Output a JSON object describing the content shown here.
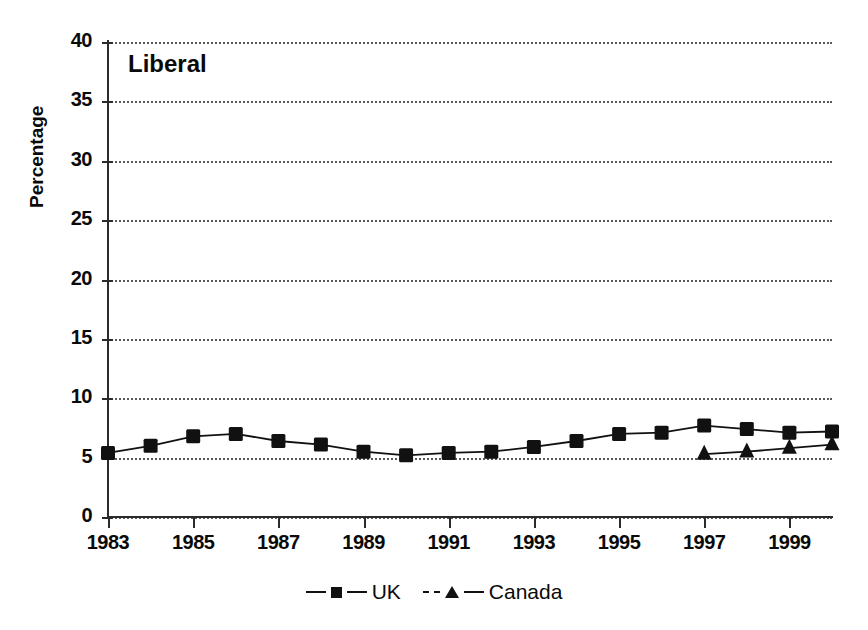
{
  "chart_data": {
    "type": "line",
    "title": "Liberal",
    "xlabel": "",
    "ylabel": "Percentage",
    "xlim": [
      1983,
      2000
    ],
    "ylim": [
      0,
      40
    ],
    "ytick_values": [
      0,
      5,
      10,
      15,
      20,
      25,
      30,
      35,
      40
    ],
    "ytick_labels": [
      "0",
      "5",
      "10",
      "15",
      "20",
      "25",
      "30",
      "35",
      "40"
    ],
    "xtick_values": [
      1983,
      1985,
      1987,
      1989,
      1991,
      1993,
      1995,
      1997,
      1999
    ],
    "xtick_labels": [
      "1983",
      "1985",
      "1987",
      "1989",
      "1991",
      "1993",
      "1995",
      "1997",
      "1999"
    ],
    "grid": "horizontal-dotted",
    "legend_position": "bottom-center",
    "x": [
      1983,
      1984,
      1985,
      1986,
      1987,
      1988,
      1989,
      1990,
      1991,
      1992,
      1993,
      1994,
      1995,
      1996,
      1997,
      1998,
      1999,
      2000
    ],
    "series": [
      {
        "name": "UK",
        "marker": "square",
        "linestyle": "solid",
        "color": "#111111",
        "x": [
          1983,
          1984,
          1985,
          1986,
          1987,
          1988,
          1989,
          1990,
          1991,
          1992,
          1993,
          1994,
          1995,
          1996,
          1997,
          1998,
          1999,
          2000
        ],
        "values": [
          5.4,
          6.0,
          6.8,
          7.0,
          6.4,
          6.1,
          5.5,
          5.2,
          5.4,
          5.5,
          5.9,
          6.4,
          7.0,
          7.1,
          7.7,
          7.4,
          7.1,
          7.2
        ]
      },
      {
        "name": "Canada",
        "marker": "triangle",
        "linestyle": "solid",
        "color": "#111111",
        "x": [
          1997,
          1998,
          1999,
          2000
        ],
        "values": [
          5.3,
          5.5,
          5.8,
          6.1
        ]
      }
    ]
  },
  "chart": {
    "title": "Liberal",
    "ylabel": "Percentage",
    "ytick_labels": [
      "40",
      "35",
      "30",
      "25",
      "20",
      "15",
      "10",
      "5",
      "0"
    ],
    "xtick_labels": [
      "1983",
      "1985",
      "1987",
      "1989",
      "1991",
      "1993",
      "1995",
      "1997",
      "1999"
    ]
  },
  "legend": {
    "entries": [
      {
        "label": "UK",
        "marker": "square-marker-icon"
      },
      {
        "label": "Canada",
        "marker": "triangle-marker-icon"
      }
    ]
  }
}
